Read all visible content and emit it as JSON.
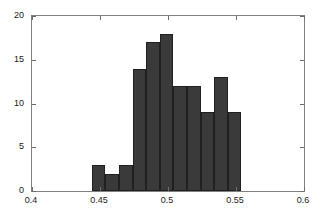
{
  "chart_data": {
    "type": "bar",
    "title": "",
    "subtitle": "",
    "xlabel": "",
    "ylabel": "",
    "xlim": [
      0.4,
      0.6
    ],
    "ylim": [
      0,
      20
    ],
    "grid": false,
    "legend": null,
    "bar_color": "#3a3a3a",
    "bar_edge_color": "#202020",
    "axis_color": "#808080",
    "bin_width": 0.01,
    "xticks": [
      {
        "value": 0.4,
        "label": "0.4"
      },
      {
        "value": 0.45,
        "label": "0.45"
      },
      {
        "value": 0.5,
        "label": "0.5"
      },
      {
        "value": 0.55,
        "label": "0.55"
      },
      {
        "value": 0.6,
        "label": "0.6"
      }
    ],
    "yticks": [
      {
        "value": 0,
        "label": "0"
      },
      {
        "value": 5,
        "label": "5"
      },
      {
        "value": 10,
        "label": "10"
      },
      {
        "value": 15,
        "label": "15"
      },
      {
        "value": 20,
        "label": "20"
      }
    ],
    "bins": [
      {
        "left": 0.444,
        "right": 0.454,
        "center": 0.449,
        "count": 3
      },
      {
        "left": 0.454,
        "right": 0.464,
        "center": 0.459,
        "count": 2
      },
      {
        "left": 0.464,
        "right": 0.474,
        "center": 0.469,
        "count": 3
      },
      {
        "left": 0.474,
        "right": 0.484,
        "center": 0.479,
        "count": 14
      },
      {
        "left": 0.484,
        "right": 0.494,
        "center": 0.489,
        "count": 17
      },
      {
        "left": 0.494,
        "right": 0.504,
        "center": 0.499,
        "count": 18
      },
      {
        "left": 0.504,
        "right": 0.514,
        "center": 0.509,
        "count": 12
      },
      {
        "left": 0.514,
        "right": 0.524,
        "center": 0.519,
        "count": 12
      },
      {
        "left": 0.524,
        "right": 0.534,
        "center": 0.529,
        "count": 9
      },
      {
        "left": 0.534,
        "right": 0.544,
        "center": 0.539,
        "count": 13
      },
      {
        "left": 0.544,
        "right": 0.554,
        "center": 0.549,
        "count": 9
      }
    ],
    "categories": [
      "0.449",
      "0.459",
      "0.469",
      "0.479",
      "0.489",
      "0.499",
      "0.509",
      "0.519",
      "0.529",
      "0.539",
      "0.549"
    ],
    "values": [
      3,
      2,
      3,
      14,
      17,
      18,
      12,
      12,
      9,
      13,
      9
    ]
  }
}
